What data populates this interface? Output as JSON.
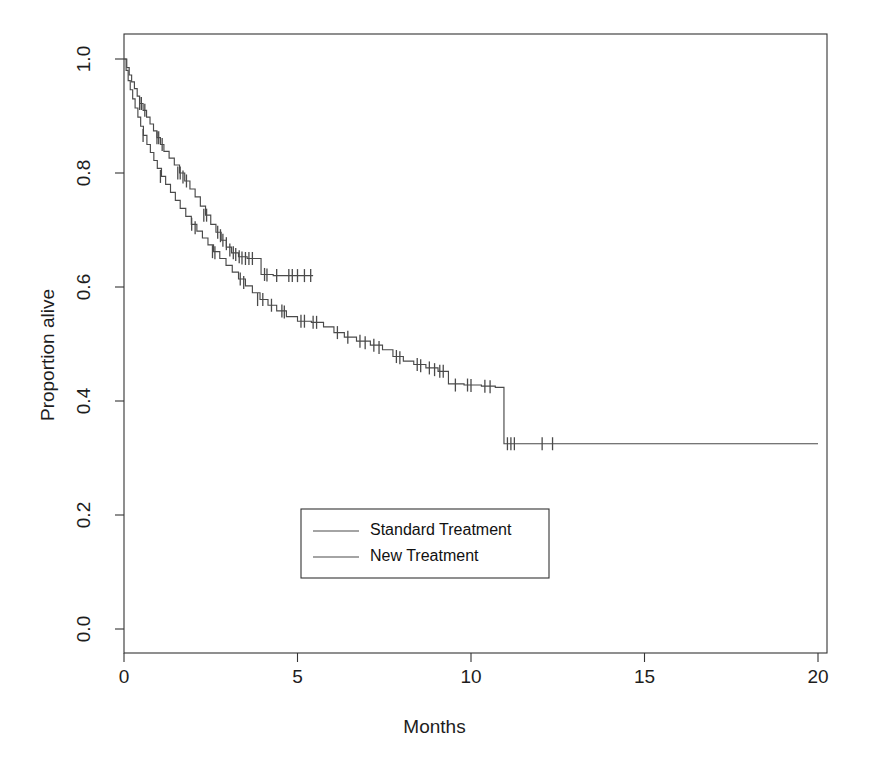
{
  "figure": {
    "title": "",
    "title_visible_fragment": "",
    "background_color": "#ffffff",
    "foreground_color": "#333333"
  },
  "axes": {
    "x": {
      "label": "Months",
      "ticks": [
        0,
        5,
        10,
        15,
        20
      ],
      "tick_labels": [
        "0",
        "5",
        "10",
        "15",
        "20"
      ],
      "lim": [
        0,
        20
      ]
    },
    "y": {
      "label": "Proportion alive",
      "ticks": [
        0.0,
        0.2,
        0.4,
        0.6,
        0.8,
        1.0
      ],
      "tick_labels": [
        "0.0",
        "0.2",
        "0.4",
        "0.6",
        "0.8",
        "1.0"
      ],
      "lim": [
        0.0,
        1.04
      ]
    }
  },
  "legend": {
    "position": "center",
    "entries": [
      {
        "label": "Standard Treatment",
        "color": "#4a4a4a"
      },
      {
        "label": "New Treatment",
        "color": "#4a4a4a"
      }
    ]
  },
  "chart_data": {
    "type": "line",
    "subtype": "kaplan-meier-survival",
    "title": "",
    "xlabel": "Months",
    "ylabel": "Proportion alive",
    "xlim": [
      0,
      20
    ],
    "ylim": [
      0.0,
      1.04
    ],
    "grid": false,
    "legend_position": "center",
    "series": [
      {
        "name": "New Treatment",
        "color": "#4a4a4a",
        "step": "post",
        "points": [
          [
            0.0,
            1.0
          ],
          [
            0.08,
            0.985
          ],
          [
            0.15,
            0.972
          ],
          [
            0.22,
            0.96
          ],
          [
            0.3,
            0.948
          ],
          [
            0.38,
            0.935
          ],
          [
            0.45,
            0.922
          ],
          [
            0.55,
            0.91
          ],
          [
            0.65,
            0.898
          ],
          [
            0.75,
            0.886
          ],
          [
            0.85,
            0.874
          ],
          [
            0.95,
            0.862
          ],
          [
            1.05,
            0.85
          ],
          [
            1.15,
            0.838
          ],
          [
            1.3,
            0.826
          ],
          [
            1.45,
            0.814
          ],
          [
            1.6,
            0.8
          ],
          [
            1.75,
            0.786
          ],
          [
            1.9,
            0.772
          ],
          [
            2.05,
            0.758
          ],
          [
            2.2,
            0.742
          ],
          [
            2.35,
            0.726
          ],
          [
            2.5,
            0.71
          ],
          [
            2.65,
            0.696
          ],
          [
            2.8,
            0.682
          ],
          [
            2.95,
            0.67
          ],
          [
            3.1,
            0.66
          ],
          [
            3.3,
            0.653
          ],
          [
            3.55,
            0.65
          ],
          [
            3.85,
            0.65
          ],
          [
            3.95,
            0.622
          ],
          [
            4.3,
            0.62
          ],
          [
            4.7,
            0.62
          ],
          [
            5.1,
            0.62
          ],
          [
            5.45,
            0.62
          ]
        ],
        "censored": [
          [
            0.45,
            0.922
          ],
          [
            0.5,
            0.922
          ],
          [
            0.6,
            0.91
          ],
          [
            0.95,
            0.862
          ],
          [
            1.0,
            0.862
          ],
          [
            1.1,
            0.85
          ],
          [
            1.55,
            0.8
          ],
          [
            1.62,
            0.8
          ],
          [
            1.7,
            0.793
          ],
          [
            1.8,
            0.786
          ],
          [
            2.3,
            0.726
          ],
          [
            2.38,
            0.726
          ],
          [
            2.7,
            0.696
          ],
          [
            2.78,
            0.69
          ],
          [
            2.85,
            0.682
          ],
          [
            2.95,
            0.676
          ],
          [
            3.05,
            0.665
          ],
          [
            3.15,
            0.66
          ],
          [
            3.22,
            0.657
          ],
          [
            3.32,
            0.653
          ],
          [
            3.4,
            0.651
          ],
          [
            3.5,
            0.65
          ],
          [
            3.6,
            0.65
          ],
          [
            3.7,
            0.65
          ],
          [
            4.05,
            0.622
          ],
          [
            4.12,
            0.621
          ],
          [
            4.4,
            0.62
          ],
          [
            4.75,
            0.62
          ],
          [
            4.85,
            0.62
          ],
          [
            5.0,
            0.62
          ],
          [
            5.2,
            0.62
          ],
          [
            5.38,
            0.62
          ]
        ]
      },
      {
        "name": "Standard Treatment",
        "color": "#4a4a4a",
        "step": "post",
        "points": [
          [
            0.0,
            1.0
          ],
          [
            0.06,
            0.98
          ],
          [
            0.12,
            0.962
          ],
          [
            0.18,
            0.946
          ],
          [
            0.25,
            0.93
          ],
          [
            0.32,
            0.914
          ],
          [
            0.4,
            0.898
          ],
          [
            0.48,
            0.882
          ],
          [
            0.56,
            0.866
          ],
          [
            0.66,
            0.85
          ],
          [
            0.76,
            0.836
          ],
          [
            0.86,
            0.822
          ],
          [
            0.96,
            0.808
          ],
          [
            1.08,
            0.794
          ],
          [
            1.2,
            0.78
          ],
          [
            1.34,
            0.766
          ],
          [
            1.48,
            0.752
          ],
          [
            1.62,
            0.738
          ],
          [
            1.78,
            0.724
          ],
          [
            1.94,
            0.71
          ],
          [
            2.1,
            0.698
          ],
          [
            2.26,
            0.686
          ],
          [
            2.42,
            0.674
          ],
          [
            2.58,
            0.662
          ],
          [
            2.76,
            0.65
          ],
          [
            2.94,
            0.638
          ],
          [
            3.12,
            0.626
          ],
          [
            3.3,
            0.614
          ],
          [
            3.5,
            0.602
          ],
          [
            3.7,
            0.59
          ],
          [
            3.92,
            0.578
          ],
          [
            4.15,
            0.568
          ],
          [
            4.4,
            0.558
          ],
          [
            4.68,
            0.548
          ],
          [
            5.0,
            0.54
          ],
          [
            5.4,
            0.538
          ],
          [
            5.75,
            0.53
          ],
          [
            6.05,
            0.52
          ],
          [
            6.35,
            0.512
          ],
          [
            6.7,
            0.505
          ],
          [
            7.1,
            0.498
          ],
          [
            7.45,
            0.49
          ],
          [
            7.75,
            0.478
          ],
          [
            8.05,
            0.47
          ],
          [
            8.35,
            0.464
          ],
          [
            8.7,
            0.458
          ],
          [
            9.05,
            0.452
          ],
          [
            9.35,
            0.43
          ],
          [
            9.8,
            0.428
          ],
          [
            10.3,
            0.426
          ],
          [
            10.7,
            0.424
          ],
          [
            10.95,
            0.325
          ],
          [
            11.6,
            0.325
          ],
          [
            12.4,
            0.325
          ],
          [
            20.0,
            0.325
          ]
        ],
        "censored": [
          [
            0.55,
            0.866
          ],
          [
            1.05,
            0.794
          ],
          [
            1.95,
            0.71
          ],
          [
            2.05,
            0.704
          ],
          [
            2.55,
            0.662
          ],
          [
            2.62,
            0.66
          ],
          [
            3.35,
            0.614
          ],
          [
            3.45,
            0.608
          ],
          [
            3.85,
            0.578
          ],
          [
            4.0,
            0.578
          ],
          [
            4.25,
            0.568
          ],
          [
            4.55,
            0.558
          ],
          [
            4.62,
            0.556
          ],
          [
            5.1,
            0.54
          ],
          [
            5.2,
            0.54
          ],
          [
            5.45,
            0.538
          ],
          [
            5.55,
            0.538
          ],
          [
            6.15,
            0.52
          ],
          [
            6.45,
            0.512
          ],
          [
            6.8,
            0.505
          ],
          [
            6.95,
            0.502
          ],
          [
            7.2,
            0.498
          ],
          [
            7.35,
            0.494
          ],
          [
            7.85,
            0.478
          ],
          [
            7.95,
            0.476
          ],
          [
            8.45,
            0.464
          ],
          [
            8.55,
            0.462
          ],
          [
            8.8,
            0.458
          ],
          [
            8.95,
            0.455
          ],
          [
            9.1,
            0.452
          ],
          [
            9.2,
            0.452
          ],
          [
            9.55,
            0.428
          ],
          [
            9.9,
            0.428
          ],
          [
            10.0,
            0.427
          ],
          [
            10.4,
            0.426
          ],
          [
            10.55,
            0.425
          ],
          [
            11.05,
            0.325
          ],
          [
            11.15,
            0.325
          ],
          [
            11.25,
            0.325
          ],
          [
            12.05,
            0.325
          ],
          [
            12.35,
            0.325
          ]
        ]
      }
    ]
  }
}
